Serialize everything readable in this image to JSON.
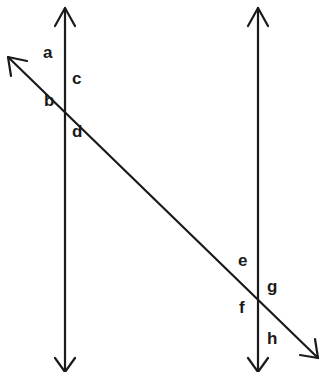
{
  "diagram": {
    "colors": {
      "line": "#1a1a1a",
      "background": "#ffffff"
    },
    "lines": [
      {
        "id": "parallel-left",
        "x1": 65,
        "y1": 370,
        "x2": 65,
        "y2": 6,
        "arrows": "both"
      },
      {
        "id": "parallel-right",
        "x1": 258,
        "y1": 370,
        "x2": 258,
        "y2": 6,
        "arrows": "both"
      },
      {
        "id": "transversal",
        "x1": 8,
        "y1": 57,
        "x2": 320,
        "y2": 360,
        "arrows": "both"
      }
    ],
    "intersections": [
      {
        "id": "left",
        "x": 65,
        "y": 91,
        "angles": [
          "a",
          "b",
          "c",
          "d"
        ]
      },
      {
        "id": "right",
        "x": 258,
        "y": 297,
        "angles": [
          "e",
          "f",
          "g",
          "h"
        ]
      }
    ],
    "labels": {
      "a": "a",
      "b": "b",
      "c": "c",
      "d": "d",
      "e": "e",
      "f": "f",
      "g": "g",
      "h": "h"
    }
  }
}
